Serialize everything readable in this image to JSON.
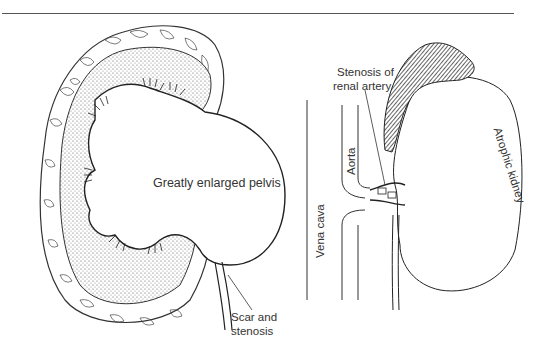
{
  "figure": {
    "left_panel": {
      "subject": "hydronephrotic-kidney",
      "labels": {
        "pelvis": "Greatly enlarged pelvis",
        "scar_line1": "Scar and",
        "scar_line2": "stenosis"
      }
    },
    "right_panel": {
      "subject": "renal-artery-stenosis",
      "labels": {
        "stenosis_line1": "Stenosis of",
        "stenosis_line2": "renal artery",
        "aorta": "Aorta",
        "vena_cava": "Vena cava",
        "atrophic_kidney": "Atrophic kidney"
      }
    }
  }
}
